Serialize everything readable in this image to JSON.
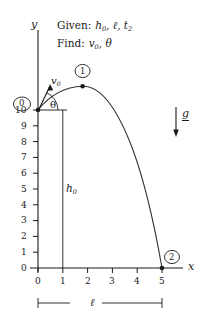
{
  "figure": {
    "title_lines": [
      {
        "key": "Given:",
        "value": "h0, ℓ, t2"
      },
      {
        "key": "Find:",
        "value": "v0, θ"
      }
    ],
    "axes": {
      "y_label": "y",
      "x_label": "x",
      "y_ticks": [
        "10",
        "9",
        "8",
        "7",
        "6",
        "5",
        "4",
        "3",
        "2",
        "1",
        "0"
      ],
      "x_ticks": [
        "0",
        "1",
        "2",
        "3",
        "4",
        "5"
      ],
      "y_range": [
        0,
        10
      ],
      "x_range": [
        0,
        5
      ]
    },
    "annotations": {
      "launch_point_label": "0",
      "apex_point_label": "1",
      "landing_point_label": "2",
      "velocity_label": "v0",
      "angle_label": "θ",
      "height_label": "h0",
      "range_label": "ℓ",
      "gravity_label": "g"
    },
    "colors": {
      "stroke": "#1a1a1a",
      "background": "#ffffff",
      "curve": "#333333"
    }
  },
  "chart_data": {
    "type": "line",
    "xlabel": "x",
    "ylabel": "y",
    "xlim": [
      0,
      5
    ],
    "ylim": [
      0,
      10
    ],
    "grid": false,
    "legend": "none",
    "series": [
      {
        "name": "trajectory",
        "x": [
          0.0,
          0.25,
          0.5,
          0.75,
          1.0,
          1.25,
          1.5,
          1.8,
          2.0,
          2.25,
          2.5,
          2.75,
          3.0,
          3.25,
          3.5,
          3.75,
          4.0,
          4.25,
          4.5,
          4.75,
          5.0
        ],
        "y": [
          10.0,
          10.48,
          10.86,
          11.15,
          11.35,
          11.46,
          11.49,
          11.45,
          11.38,
          11.22,
          10.98,
          10.64,
          10.2,
          9.66,
          9.02,
          8.28,
          7.43,
          6.48,
          5.42,
          4.25,
          0.0
        ]
      }
    ],
    "points": [
      {
        "label": "0",
        "x": 0.0,
        "y": 10.0
      },
      {
        "label": "1",
        "x": 1.8,
        "y": 11.45
      },
      {
        "label": "2",
        "x": 5.0,
        "y": 0.0
      }
    ],
    "annotations": [
      {
        "text": "v0",
        "type": "vector",
        "x": 0.0,
        "y": 10.0
      },
      {
        "text": "θ",
        "type": "angle",
        "x": 0.0,
        "y": 10.0
      },
      {
        "text": "h0",
        "type": "dimension",
        "from": [
          1.0,
          0.0
        ],
        "to": [
          1.0,
          10.0
        ]
      },
      {
        "text": "ℓ",
        "type": "dimension",
        "from": [
          0.0,
          0.0
        ],
        "to": [
          5.0,
          0.0
        ]
      },
      {
        "text": "g",
        "type": "vector",
        "direction": "down"
      }
    ]
  }
}
